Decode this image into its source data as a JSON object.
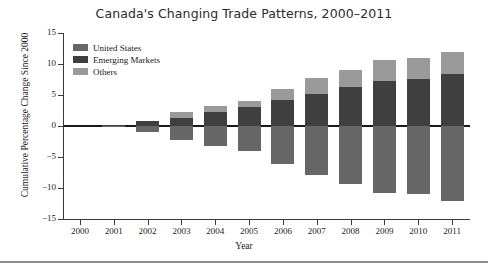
{
  "chart_data": {
    "type": "bar",
    "title": "Canada's Changing Trade Patterns, 2000–2011",
    "xlabel": "Year",
    "ylabel": "Cumulative Percentage Change Since 2000",
    "ylim": [
      -15,
      15
    ],
    "yticks": [
      "15",
      "10",
      "5",
      "0",
      "−5",
      "−10",
      "−15"
    ],
    "ytick_values": [
      15,
      10,
      5,
      0,
      -5,
      -10,
      -15
    ],
    "grid": false,
    "stacked": true,
    "legend_position": "upper left",
    "categories": [
      "2000",
      "2001",
      "2002",
      "2003",
      "2004",
      "2005",
      "2006",
      "2007",
      "2008",
      "2009",
      "2010",
      "2011"
    ],
    "series": [
      {
        "name": "United States",
        "color": "#666666",
        "values": [
          0,
          -0.2,
          -0.9,
          -2.2,
          -3.2,
          -4.1,
          -6.1,
          -7.9,
          -9.3,
          -10.8,
          -11.0,
          -12.1
        ]
      },
      {
        "name": "Emerging Markets",
        "color": "#3f3f3f",
        "values": [
          0,
          0.2,
          0.8,
          1.3,
          2.3,
          3.1,
          4.2,
          5.1,
          6.3,
          7.2,
          7.6,
          8.4
        ]
      },
      {
        "name": "Others",
        "color": "#9a9a9a",
        "values": [
          0,
          0.0,
          0.0,
          0.9,
          0.9,
          1.0,
          1.7,
          2.7,
          2.8,
          3.5,
          3.4,
          3.6
        ]
      }
    ],
    "notes": {
      "positive_stack_order": [
        "Emerging Markets",
        "Others"
      ],
      "negative_stack_order": [
        "United States"
      ]
    }
  },
  "legend": {
    "items": [
      {
        "label": "United States",
        "color": "#666666"
      },
      {
        "label": "Emerging Markets",
        "color": "#3f3f3f"
      },
      {
        "label": "Others",
        "color": "#9a9a9a"
      }
    ]
  },
  "colors": {
    "axis": "#3a3a3a",
    "zero_line": "#1a1a1a",
    "text": "#1a1a1a",
    "title": "#2b2b2b",
    "footer_rule": "#8d8d8d",
    "background": "#ffffff"
  }
}
